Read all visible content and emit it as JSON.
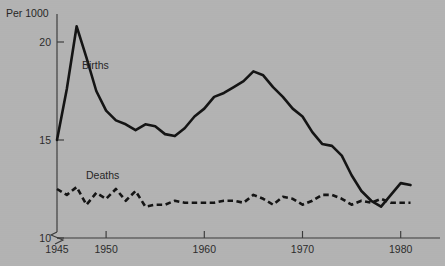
{
  "chart_data": {
    "type": "line",
    "title": "",
    "subtitle": "",
    "xlabel": "",
    "ylabel": "Per 1000",
    "xlim": [
      1945,
      1984
    ],
    "ylim": [
      9.6,
      21.4
    ],
    "grid": false,
    "legend_position": "inline-annotations",
    "y_axis_break": true,
    "y_ticks": [
      10,
      15,
      20
    ],
    "y_tick_labels": [
      "10",
      "15",
      "20"
    ],
    "x_ticks": [
      1945,
      1950,
      1960,
      1970,
      1980
    ],
    "x_tick_labels": [
      "1945",
      "1950",
      "1960",
      "1970",
      "1980"
    ],
    "annotations": [
      {
        "name": "births-label",
        "text": "Births",
        "x": 1947.6,
        "y": 18.35
      },
      {
        "name": "deaths-label",
        "text": "Deaths",
        "x": 1948.0,
        "y": 14.0
      }
    ],
    "series": [
      {
        "name": "Births",
        "style": "solid",
        "color": "#141414",
        "x": [
          1945,
          1946,
          1947,
          1948,
          1949,
          1950,
          1951,
          1952,
          1953,
          1954,
          1955,
          1956,
          1957,
          1958,
          1959,
          1960,
          1961,
          1962,
          1963,
          1964,
          1965,
          1966,
          1967,
          1968,
          1969,
          1970,
          1971,
          1972,
          1973,
          1974,
          1975,
          1976,
          1977,
          1978,
          1979,
          1980,
          1981
        ],
        "values": [
          15.0,
          17.6,
          20.8,
          19.2,
          17.5,
          16.5,
          16.0,
          15.8,
          15.5,
          15.8,
          15.7,
          15.3,
          15.2,
          15.6,
          16.2,
          16.6,
          17.2,
          17.4,
          17.7,
          18.0,
          18.5,
          18.3,
          17.7,
          17.2,
          16.6,
          16.2,
          15.4,
          14.8,
          14.7,
          14.2,
          13.2,
          12.4,
          11.9,
          11.6,
          12.2,
          12.8,
          12.7
        ]
      },
      {
        "name": "Deaths",
        "style": "dashed",
        "color": "#141414",
        "x": [
          1945,
          1946,
          1947,
          1948,
          1949,
          1950,
          1951,
          1952,
          1953,
          1954,
          1955,
          1956,
          1957,
          1958,
          1959,
          1960,
          1961,
          1962,
          1963,
          1964,
          1965,
          1966,
          1967,
          1968,
          1969,
          1970,
          1971,
          1972,
          1973,
          1974,
          1975,
          1976,
          1977,
          1978,
          1979,
          1980,
          1981
        ],
        "values": [
          12.5,
          12.2,
          12.6,
          11.7,
          12.3,
          12.0,
          12.5,
          11.9,
          12.4,
          11.6,
          11.7,
          11.7,
          11.9,
          11.8,
          11.8,
          11.8,
          11.8,
          11.9,
          11.9,
          11.8,
          12.2,
          12.0,
          11.7,
          12.1,
          12.0,
          11.7,
          11.9,
          12.2,
          12.2,
          12.0,
          11.7,
          11.9,
          11.8,
          12.0,
          11.8,
          11.8,
          11.8
        ]
      }
    ]
  },
  "geometry": {
    "plot_left": 57,
    "plot_right": 440,
    "x_min_year": 1945,
    "px_per_year": 9.82,
    "y_for_20": 42,
    "y_for_10": 238,
    "axis_top": 14,
    "axis_bottom": 238
  }
}
